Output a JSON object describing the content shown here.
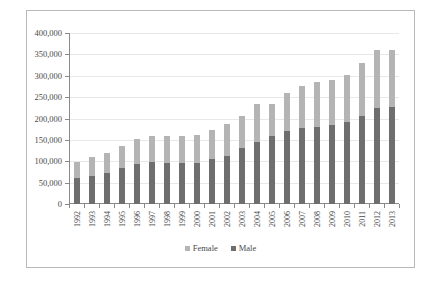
{
  "chart_data": {
    "type": "bar",
    "title": "",
    "xlabel": "",
    "ylabel": "",
    "stacked": true,
    "grid": true,
    "legend_position": "bottom-center",
    "ylim": [
      0,
      400000
    ],
    "ytick_labels": [
      "400,000",
      "350,000",
      "300,000",
      "250,000",
      "200,000",
      "150,000",
      "100,000",
      "50,000",
      "0"
    ],
    "ytick_values": [
      400000,
      350000,
      300000,
      250000,
      200000,
      150000,
      100000,
      50000,
      0
    ],
    "categories": [
      "1992",
      "1993",
      "1994",
      "1995",
      "1996",
      "1997",
      "1998",
      "1999",
      "2000",
      "2001",
      "2002",
      "2003",
      "2004",
      "2005",
      "2006",
      "2007",
      "2008",
      "2009",
      "2010",
      "2011",
      "2012",
      "2013"
    ],
    "series": [
      {
        "name": "Male",
        "color": "#6e6e6e",
        "values": [
          61000,
          66000,
          73000,
          84000,
          94000,
          99000,
          97000,
          95000,
          97000,
          106000,
          113000,
          130000,
          144000,
          160000,
          171000,
          177000,
          180000,
          186000,
          193000,
          207000,
          225000,
          226000
        ]
      },
      {
        "name": "Female",
        "color": "#b4b4b4",
        "values": [
          38000,
          43000,
          47000,
          52000,
          58000,
          61000,
          63000,
          63000,
          65000,
          67000,
          74000,
          75000,
          89000,
          73000,
          88000,
          100000,
          105000,
          105000,
          108000,
          123000,
          136000,
          135000
        ]
      }
    ],
    "totals": [
      99000,
      109000,
      120000,
      136000,
      152000,
      160000,
      160000,
      158000,
      162000,
      173000,
      187000,
      205000,
      233000,
      233000,
      259000,
      277000,
      285000,
      291000,
      301000,
      330000,
      361000,
      361000
    ],
    "legend": [
      {
        "label": "Female",
        "color": "#b4b4b4"
      },
      {
        "label": "Male",
        "color": "#6e6e6e"
      }
    ]
  }
}
